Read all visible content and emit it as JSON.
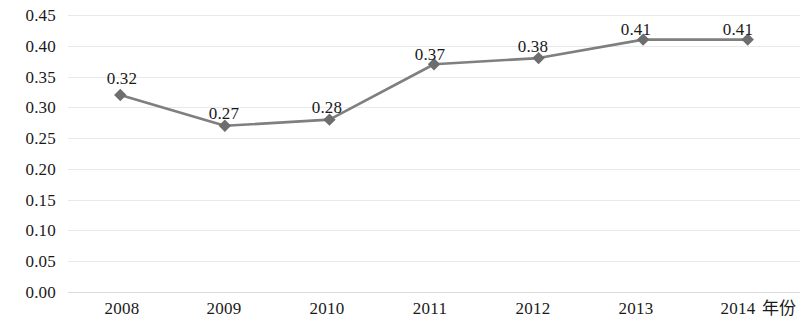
{
  "chart_data": {
    "type": "line",
    "title": "",
    "xlabel": "年份",
    "ylabel": "",
    "categories": [
      "2008",
      "2009",
      "2010",
      "2011",
      "2012",
      "2013",
      "2014"
    ],
    "values": [
      0.32,
      0.27,
      0.28,
      0.37,
      0.38,
      0.41,
      0.41
    ],
    "point_labels": [
      "0.32",
      "0.27",
      "0.28",
      "0.37",
      "0.38",
      "0.41",
      "0.41"
    ],
    "ylim": [
      0.0,
      0.45
    ],
    "ytick_labels": [
      "0.45",
      "0.40",
      "0.35",
      "0.30",
      "0.25",
      "0.20",
      "0.15",
      "0.10",
      "0.05",
      "0.00"
    ],
    "ytick_values": [
      0.45,
      0.4,
      0.35,
      0.3,
      0.25,
      0.2,
      0.15,
      0.1,
      0.05,
      0.0
    ],
    "grid": true,
    "legend": false,
    "series": [
      {
        "name": "",
        "values": [
          0.32,
          0.27,
          0.28,
          0.37,
          0.38,
          0.41,
          0.41
        ],
        "line_color": "#7f7f7f",
        "marker": "diamond",
        "marker_color": "#6e6e6e"
      }
    ],
    "colors": {
      "line": "#7f7f7f",
      "marker": "#6e6e6e",
      "gridline": "#e9e9e9",
      "axis": "#dcdcdc",
      "text": "#1a1a1a",
      "background": "#ffffff"
    }
  }
}
